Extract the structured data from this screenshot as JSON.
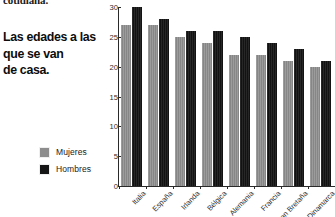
{
  "article": {
    "kicker": "cotidiana.",
    "headline_lines": [
      "Las edades a las",
      "que se van",
      "de casa."
    ]
  },
  "chart_data": {
    "type": "bar",
    "title": "",
    "subtitle": "",
    "xlabel": "",
    "ylabel": "",
    "ylim": [
      0,
      30
    ],
    "yticks": [
      0,
      5,
      10,
      15,
      20,
      25,
      30
    ],
    "grid": false,
    "legend_position": "left-outside",
    "categories": [
      "Italia",
      "España",
      "Irlanda",
      "Bélgica",
      "Alemania",
      "Francia",
      "Gran Bretaña",
      "Dinamarca"
    ],
    "series": [
      {
        "name": "Mujeres",
        "color": "#8d8d8d",
        "values": [
          27,
          27,
          25,
          24,
          22,
          22,
          21,
          20
        ]
      },
      {
        "name": "Hombres",
        "color": "#171717",
        "values": [
          30,
          28,
          26,
          26,
          25,
          24,
          23,
          21
        ]
      }
    ]
  },
  "legend": {
    "items": [
      {
        "label": "Mujeres",
        "swatch": "#8d8d8d"
      },
      {
        "label": "Hombres",
        "swatch": "#171717"
      }
    ]
  }
}
